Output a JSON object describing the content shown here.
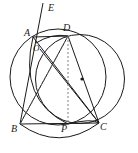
{
  "figure": {
    "width": 138,
    "height": 153,
    "background": "#ffffff",
    "stroke_color": "#1a1a1a",
    "dash_color": "#555555",
    "labels": [
      {
        "name": "E",
        "text": "E",
        "x": 48,
        "y": 4
      },
      {
        "name": "A",
        "text": "A",
        "x": 25,
        "y": 29
      },
      {
        "name": "D",
        "text": "D",
        "x": 64,
        "y": 24
      },
      {
        "name": "O",
        "text": "O",
        "x": 33,
        "y": 45
      },
      {
        "name": "B",
        "text": "B",
        "x": 13,
        "y": 124
      },
      {
        "name": "P",
        "text": "P",
        "x": 62,
        "y": 124
      },
      {
        "name": "C",
        "text": "C",
        "x": 100,
        "y": 122
      }
    ],
    "points": {
      "E": {
        "x": 43,
        "y": 3
      },
      "A": {
        "x": 33,
        "y": 37
      },
      "D": {
        "x": 68,
        "y": 36
      },
      "O": {
        "x": 40,
        "y": 49
      },
      "B": {
        "x": 20,
        "y": 124
      },
      "P": {
        "x": 68,
        "y": 124
      },
      "C": {
        "x": 99,
        "y": 123
      },
      "center_dot": {
        "x": 82,
        "y": 79
      }
    },
    "circles": [
      {
        "name": "circumcircle-ABC",
        "cx": 58,
        "cy": 77,
        "r": 48,
        "style": "solid"
      },
      {
        "name": "circle-through-D-C",
        "cx": 80,
        "cy": 79,
        "r": 44,
        "style": "solid"
      },
      {
        "name": "arc-B-P-C-lower",
        "style": "solid",
        "note": "arc through B, below P, to C"
      }
    ],
    "segments": [
      {
        "name": "line-EA-B",
        "from": "E",
        "to": "B",
        "style": "solid"
      },
      {
        "name": "chord-AD",
        "from": "A",
        "to": "D",
        "style": "solid"
      },
      {
        "name": "chord-AC",
        "from": "A",
        "to": "C",
        "style": "solid"
      },
      {
        "name": "side-BC",
        "from": "B",
        "to": "C",
        "style": "solid"
      },
      {
        "name": "chord-DC",
        "from": "D",
        "to": "C",
        "style": "solid"
      },
      {
        "name": "chord-DB",
        "from": "D",
        "to": "B",
        "style": "dashed"
      },
      {
        "name": "altitude-DP",
        "from": "D",
        "to": "P",
        "style": "dashed"
      },
      {
        "name": "segment-OC",
        "from": "O",
        "to": "C",
        "style": "solid"
      },
      {
        "name": "segment-BD-extended",
        "from": "B",
        "to": "D",
        "style": "solid"
      }
    ]
  }
}
